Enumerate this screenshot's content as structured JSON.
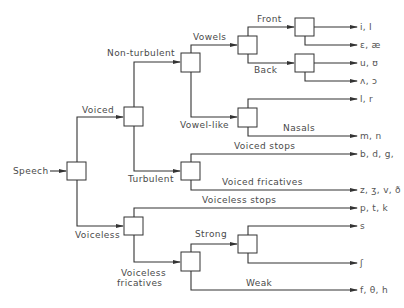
{
  "diagram": {
    "type": "decision-tree",
    "root": "Speech",
    "branch_labels": {
      "speech": "Speech",
      "voiced": "Voiced",
      "voiceless": "Voiceless",
      "non_turbulent": "Non-turbulent",
      "turbulent": "Turbulent",
      "vowels": "Vowels",
      "vowel_like": "Vowel-like",
      "front": "Front",
      "back": "Back",
      "nasals": "Nasals",
      "voiced_stops": "Voiced stops",
      "voiced_fricatives": "Voiced fricatives",
      "voiceless_stops": "Voiceless stops",
      "voiceless_fricatives_1": "Voiceless",
      "voiceless_fricatives_2": "fricatives",
      "strong": "Strong",
      "weak": "Weak"
    },
    "outputs": {
      "front_1": "i, I",
      "front_2": "ɛ, æ",
      "back_1": "u, ʊ",
      "back_2": "ʌ, ɔ",
      "vowel_like_1": "l, r",
      "nasals": "m, n",
      "voiced_stops": "b, d, g,",
      "voiced_fricatives": "z, ʒ, v, ð",
      "voiceless_stops": "p, t, k",
      "strong_1": "s",
      "strong_2": "ʃ",
      "weak": "f, θ, h"
    },
    "colors": {
      "line": "#333333",
      "text": "#4a4a4a",
      "background": "#ffffff"
    }
  }
}
